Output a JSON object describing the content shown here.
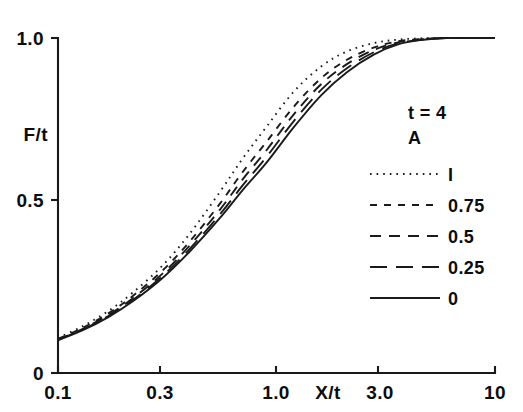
{
  "chart_data": {
    "type": "line",
    "title": "",
    "xlabel": "X/t",
    "ylabel": "F/t",
    "xscale": "log",
    "yscale": "linear",
    "xlim": [
      0.1,
      10
    ],
    "ylim": [
      0,
      1.0
    ],
    "grid": false,
    "x_ticks": [
      {
        "value": 0.1,
        "label": "0.1"
      },
      {
        "value": 0.3,
        "label": "0.3"
      },
      {
        "value": 1.0,
        "label": "1.0"
      },
      {
        "value": 3.0,
        "label": "3.0"
      },
      {
        "value": 10.0,
        "label": "10"
      }
    ],
    "y_ticks": [
      {
        "value": 0.0,
        "label": "0"
      },
      {
        "value": 0.5,
        "label": "0.5"
      },
      {
        "value": 1.0,
        "label": "1.0"
      }
    ],
    "legend_position": "upper-right",
    "legend_header_line1": "t = 4",
    "legend_header_line2": "A",
    "x": [
      0.1,
      0.13,
      0.17,
      0.22,
      0.3,
      0.4,
      0.55,
      0.7,
      0.9,
      1.2,
      1.6,
      2.1,
      2.8,
      3.6,
      4.6,
      6.0,
      8.0,
      10.0
    ],
    "series": [
      {
        "name": "1",
        "label": "I",
        "A": 1,
        "dash": "dotted",
        "values": [
          0.105,
          0.14,
          0.185,
          0.24,
          0.32,
          0.415,
          0.54,
          0.64,
          0.735,
          0.84,
          0.915,
          0.96,
          0.985,
          0.995,
          0.999,
          1.0,
          1.0,
          1.0
        ]
      },
      {
        "name": "0.75",
        "label": "0.75",
        "A": 0.75,
        "dash": "dashed-short",
        "values": [
          0.102,
          0.135,
          0.178,
          0.23,
          0.305,
          0.392,
          0.505,
          0.6,
          0.69,
          0.795,
          0.88,
          0.935,
          0.972,
          0.99,
          0.997,
          1.0,
          1.0,
          1.0
        ]
      },
      {
        "name": "0.5",
        "label": "0.5",
        "A": 0.5,
        "dash": "dashed-medium",
        "values": [
          0.1,
          0.132,
          0.173,
          0.223,
          0.296,
          0.38,
          0.487,
          0.578,
          0.665,
          0.772,
          0.862,
          0.922,
          0.965,
          0.987,
          0.996,
          1.0,
          1.0,
          1.0
        ]
      },
      {
        "name": "0.25",
        "label": "0.25",
        "A": 0.25,
        "dash": "dashed-long",
        "values": [
          0.099,
          0.13,
          0.17,
          0.218,
          0.289,
          0.37,
          0.473,
          0.56,
          0.645,
          0.752,
          0.845,
          0.91,
          0.958,
          0.984,
          0.995,
          1.0,
          1.0,
          1.0
        ]
      },
      {
        "name": "0",
        "label": "0",
        "A": 0,
        "dash": "solid",
        "values": [
          0.098,
          0.128,
          0.167,
          0.214,
          0.283,
          0.362,
          0.462,
          0.546,
          0.628,
          0.734,
          0.829,
          0.898,
          0.951,
          0.981,
          0.994,
          1.0,
          1.0,
          1.0
        ]
      }
    ]
  }
}
